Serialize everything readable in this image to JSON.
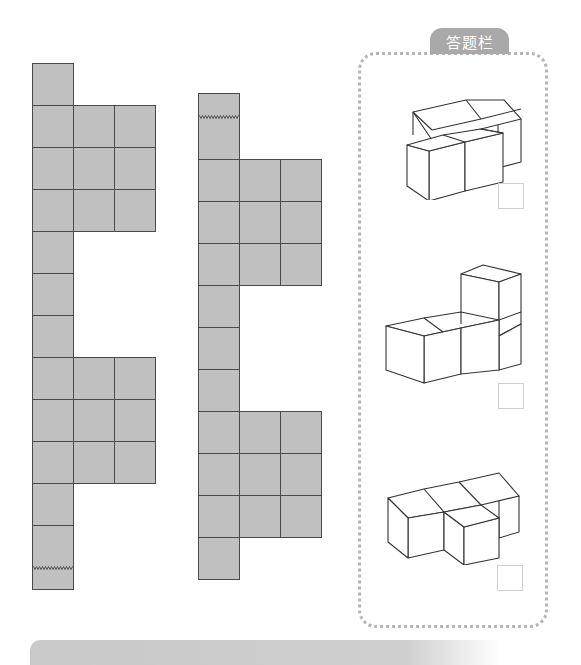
{
  "answer_panel": {
    "title": "答题栏",
    "options": [
      {
        "id": "A",
        "shape": "L-shaped 4-cube solid (2 front cubes, 2 back cubes offset right)",
        "checkbox_checked": false
      },
      {
        "id": "B",
        "shape": "L-shaped 4-cube solid (3 in a row, 1 stacked on right)",
        "checkbox_checked": false
      },
      {
        "id": "C",
        "shape": "T/S-shaped 4-cube solid (3 back row, 1 front middle)",
        "checkbox_checked": false
      }
    ]
  },
  "colors": {
    "cell_fill": "#c0c0c0",
    "cell_border": "#4a4a4a",
    "panel_border": "#b5b5b5",
    "tab_bg": "#a9a9a9",
    "tab_text": "#ffffff",
    "checkbox_border": "#cfcfcf"
  },
  "nets": [
    {
      "name": "left-net",
      "cell_width": 41,
      "cell_height": 42,
      "origin_x": 32,
      "origin_y": 63,
      "zigzag_y": 568,
      "rows": [
        [
          0
        ],
        [
          0,
          1,
          2
        ],
        [
          0,
          1,
          2
        ],
        [
          0,
          1,
          2
        ],
        [
          0
        ],
        [
          0
        ],
        [
          0
        ],
        [
          0,
          1,
          2
        ],
        [
          0,
          1,
          2
        ],
        [
          0,
          1,
          2
        ],
        [
          0
        ],
        [
          0
        ]
      ]
    },
    {
      "name": "middle-net",
      "cell_width": 41,
      "cell_height": 42,
      "origin_x": 198,
      "origin_y": 93,
      "zigzag_y": 117,
      "rows": [
        [
          0
        ],
        [
          0,
          1,
          2
        ],
        [
          0,
          1,
          2
        ],
        [
          0,
          1,
          2
        ],
        [
          0
        ],
        [
          0
        ],
        [
          0
        ],
        [
          0,
          1,
          2
        ],
        [
          0,
          1,
          2
        ],
        [
          0,
          1,
          2
        ],
        [
          0
        ]
      ]
    }
  ]
}
